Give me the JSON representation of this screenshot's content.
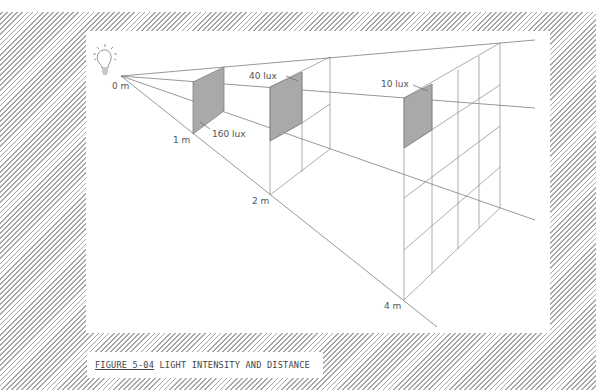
{
  "figure": {
    "number_label": "FIGURE 5-04",
    "title": "LIGHT INTENSITY AND DISTANCE"
  },
  "diagram": {
    "source_icon": "light-bulb-icon",
    "distance_labels": {
      "d0": "0 m",
      "d1": "1 m",
      "d2": "2 m",
      "d4": "4 m"
    },
    "lux_labels": {
      "at_1m": "160 lux",
      "at_2m": "40 lux",
      "at_4m": "10 lux"
    },
    "colors": {
      "line": "#7a7a7a",
      "shade": "#a8a8a8",
      "hatch": "#9a9a9a"
    }
  }
}
